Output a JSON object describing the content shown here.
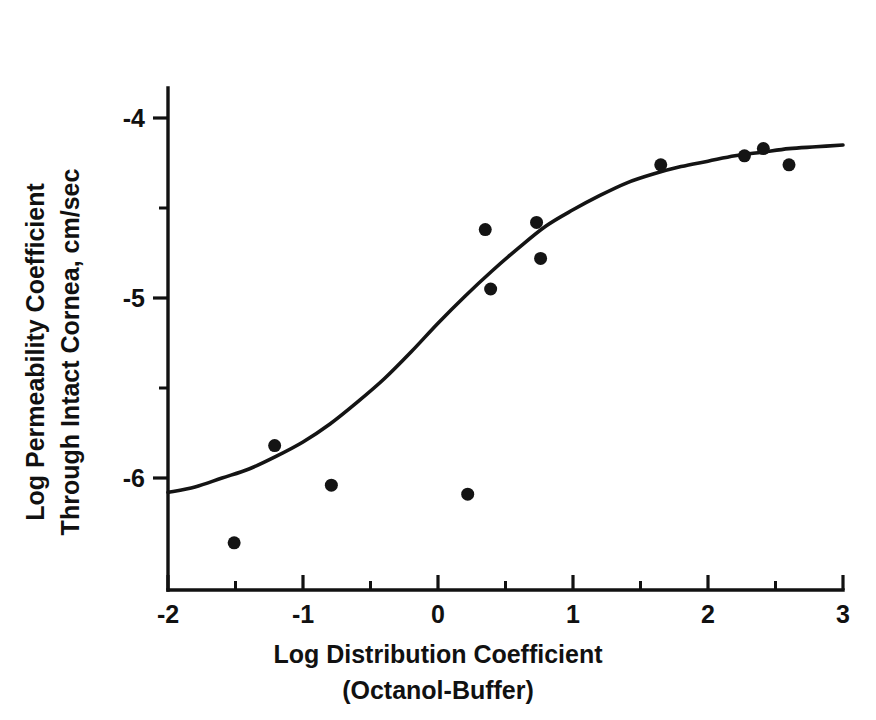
{
  "chart_data": {
    "type": "scatter",
    "title": "",
    "subtitle": "",
    "xlabel": "Log Distribution Coefficient",
    "xlabel_line2": "(Octanol-Buffer)",
    "ylabel": "Log Permeability Coefficient",
    "ylabel_line2": "Through Intact Cornea, cm/sec",
    "xlim": [
      -2,
      3
    ],
    "ylim": [
      -6.43,
      -3.72
    ],
    "x_ticks": [
      -2,
      -1,
      0,
      1,
      2,
      3
    ],
    "x_tick_labels": [
      "-2",
      "-1",
      "0",
      "1",
      "2",
      "3"
    ],
    "x_minor_ticks": [
      -1.5,
      -0.5,
      0.5,
      1.5,
      2.5
    ],
    "y_ticks": [
      -4,
      -5,
      -6
    ],
    "y_tick_labels": [
      "-4",
      "-5",
      "-6"
    ],
    "y_minor_ticks": [
      -4.5,
      -5.5
    ],
    "grid": false,
    "legend": "none",
    "marker": "filled-circle",
    "marker_color": "#141414",
    "marker_size_px": 13,
    "curve_color": "#141414",
    "points": [
      {
        "x": -1.51,
        "y": -6.36
      },
      {
        "x": -1.21,
        "y": -5.82
      },
      {
        "x": -0.79,
        "y": -6.04
      },
      {
        "x": 0.22,
        "y": -6.09
      },
      {
        "x": 0.35,
        "y": -4.62
      },
      {
        "x": 0.39,
        "y": -4.95
      },
      {
        "x": 0.73,
        "y": -4.58
      },
      {
        "x": 0.76,
        "y": -4.78
      },
      {
        "x": 1.65,
        "y": -4.26
      },
      {
        "x": 2.27,
        "y": -4.21
      },
      {
        "x": 2.41,
        "y": -4.17
      },
      {
        "x": 2.6,
        "y": -4.26
      }
    ],
    "fit_curve": {
      "kind": "sigmoid",
      "description": "Sigmoidal fit of log permeability vs log distribution coefficient",
      "points": [
        {
          "x": -2.0,
          "y": -6.08
        },
        {
          "x": -1.8,
          "y": -6.05
        },
        {
          "x": -1.6,
          "y": -6.0
        },
        {
          "x": -1.4,
          "y": -5.95
        },
        {
          "x": -1.2,
          "y": -5.88
        },
        {
          "x": -1.0,
          "y": -5.8
        },
        {
          "x": -0.8,
          "y": -5.7
        },
        {
          "x": -0.6,
          "y": -5.58
        },
        {
          "x": -0.4,
          "y": -5.45
        },
        {
          "x": -0.2,
          "y": -5.3
        },
        {
          "x": 0.0,
          "y": -5.14
        },
        {
          "x": 0.2,
          "y": -4.99
        },
        {
          "x": 0.4,
          "y": -4.85
        },
        {
          "x": 0.6,
          "y": -4.72
        },
        {
          "x": 0.8,
          "y": -4.6
        },
        {
          "x": 1.0,
          "y": -4.51
        },
        {
          "x": 1.2,
          "y": -4.43
        },
        {
          "x": 1.4,
          "y": -4.36
        },
        {
          "x": 1.6,
          "y": -4.31
        },
        {
          "x": 1.8,
          "y": -4.27
        },
        {
          "x": 2.0,
          "y": -4.24
        },
        {
          "x": 2.2,
          "y": -4.21
        },
        {
          "x": 2.4,
          "y": -4.19
        },
        {
          "x": 2.6,
          "y": -4.17
        },
        {
          "x": 2.8,
          "y": -4.16
        },
        {
          "x": 3.0,
          "y": -4.15
        }
      ]
    }
  },
  "axes": {
    "x_axis_name": "x-axis",
    "y_axis_name": "y-axis"
  }
}
